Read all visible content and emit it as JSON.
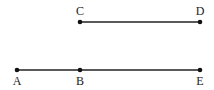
{
  "diagram": {
    "type": "line-segments",
    "points": [
      {
        "id": "A",
        "label": "A",
        "x": 17,
        "y": 70,
        "label_pos": "below"
      },
      {
        "id": "B",
        "label": "B",
        "x": 80,
        "y": 70,
        "label_pos": "below"
      },
      {
        "id": "E",
        "label": "E",
        "x": 200,
        "y": 70,
        "label_pos": "below"
      },
      {
        "id": "C",
        "label": "C",
        "x": 80,
        "y": 22,
        "label_pos": "above"
      },
      {
        "id": "D",
        "label": "D",
        "x": 200,
        "y": 22,
        "label_pos": "above"
      }
    ],
    "segments": [
      {
        "from": "C",
        "to": "D"
      },
      {
        "from": "A",
        "to": "E"
      }
    ],
    "colors": {
      "line": "#222222",
      "point": "#111111"
    }
  }
}
